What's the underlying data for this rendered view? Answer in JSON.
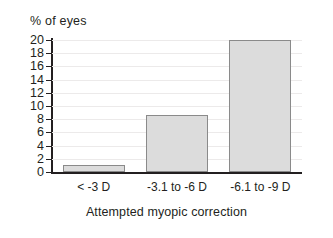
{
  "chart_data": {
    "type": "bar",
    "title": "",
    "subtitle": "",
    "xlabel": "Attempted myopic correction",
    "ylabel": "% of eyes",
    "categories": [
      "< -3 D",
      "-3.1 to -6 D",
      "-6.1 to -9 D"
    ],
    "values": [
      1,
      8.7,
      20
    ],
    "ylim": [
      0,
      20
    ],
    "yticks": [
      0,
      2,
      4,
      6,
      8,
      10,
      12,
      14,
      16,
      18,
      20
    ],
    "ytick_labels": [
      "0",
      "2",
      "4",
      "6",
      "8",
      "10",
      "12",
      "14",
      "16",
      "18",
      "20"
    ],
    "grid": true,
    "grid_axis": "y",
    "legend": false,
    "legend_position": "none",
    "bar_fill_color": "#dcdcdc",
    "bar_edge_color": "#8a8a8a",
    "axis_color": "#231f20",
    "grid_color": "#eceaea",
    "background_color": "#ffffff"
  }
}
